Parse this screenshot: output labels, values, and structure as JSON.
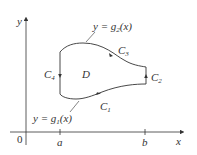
{
  "diagram": {
    "type": "region-boundary",
    "axes": {
      "x_label": "x",
      "y_label": "y",
      "origin_label": "0"
    },
    "ticks": {
      "a": "a",
      "b": "b"
    },
    "region_label": "D",
    "curves": [
      {
        "name": "C",
        "sub": "1",
        "description": "bottom curve, left to right"
      },
      {
        "name": "C",
        "sub": "2",
        "description": "right vertical segment, upward"
      },
      {
        "name": "C",
        "sub": "3",
        "description": "top curve, right to left"
      },
      {
        "name": "C",
        "sub": "4",
        "description": "left vertical segment, downward"
      }
    ],
    "annotations": {
      "top": {
        "prefix": "y = g",
        "sub": "2",
        "suffix": "(x)"
      },
      "bottom": {
        "prefix": "y = g",
        "sub": "1",
        "suffix": "(x)"
      }
    },
    "colors": {
      "stroke": "#333333"
    }
  }
}
